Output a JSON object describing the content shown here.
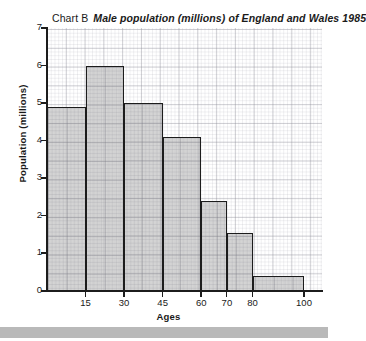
{
  "chart_data": {
    "type": "bar",
    "title_lead": "Chart B",
    "title": "Male population (millions) of England and Wales 1985",
    "xlabel": "Ages",
    "ylabel": "Population (millions)",
    "xlim": [
      0,
      110
    ],
    "ylim": [
      0,
      7
    ],
    "grid": true,
    "legend": "none",
    "y_ticks": [
      "7",
      "6",
      "5",
      "4",
      "3",
      "2",
      "1",
      "0"
    ],
    "y_tick_values": [
      7,
      6,
      5,
      4,
      3,
      2,
      1,
      0
    ],
    "x_ticks": [
      "15",
      "30",
      "45",
      "60",
      "70",
      "80",
      "100"
    ],
    "x_tick_values": [
      15,
      30,
      45,
      60,
      70,
      80,
      100
    ],
    "bin_edges": [
      0,
      15,
      30,
      45,
      60,
      70,
      80,
      100
    ],
    "categories": [
      "0-15",
      "15-30",
      "30-45",
      "45-60",
      "60-70",
      "70-80",
      "80-100"
    ],
    "values": [
      4.9,
      6.0,
      5.0,
      4.1,
      2.4,
      1.55,
      0.4
    ],
    "bar_fill_color": "#c4c4c4",
    "bar_edge_color": "#1c1c1c",
    "background_color": "#ffffff"
  },
  "figure": {
    "bars": [
      {
        "label": "0-15",
        "value": 4.9,
        "x0": 0,
        "x1": 15
      },
      {
        "label": "15-30",
        "value": 6.0,
        "x0": 15,
        "x1": 30
      },
      {
        "label": "30-45",
        "value": 5.0,
        "x0": 30,
        "x1": 45
      },
      {
        "label": "45-60",
        "value": 4.1,
        "x0": 45,
        "x1": 60
      },
      {
        "label": "60-70",
        "value": 2.4,
        "x0": 60,
        "x1": 70
      },
      {
        "label": "70-80",
        "value": 1.55,
        "x0": 70,
        "x1": 80
      },
      {
        "label": "80-100",
        "value": 0.4,
        "x0": 80,
        "x1": 100
      }
    ]
  }
}
